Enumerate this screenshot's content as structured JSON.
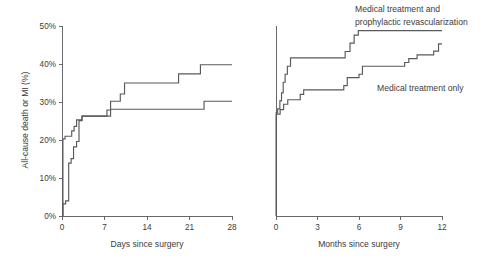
{
  "figure": {
    "title": "",
    "panels": [
      "days-panel",
      "months-panel"
    ]
  },
  "axes": {
    "y_label": "All-cause death or MI (%)",
    "y_ticks": [
      "0%",
      "10%",
      "20%",
      "30%",
      "40%",
      "50%"
    ],
    "x_label_left": "Days since surgery",
    "x_ticks_left": [
      "0",
      "7",
      "14",
      "21",
      "28"
    ],
    "x_label_right": "Months since surgery",
    "x_ticks_right": [
      "0",
      "3",
      "6",
      "9",
      "12"
    ]
  },
  "annotations": {
    "revascularization_line1": "Medical treatment and",
    "revascularization_line2": "prophylactic revascularization",
    "medical_only": "Medical treatment only"
  },
  "colors": {
    "line": "#58595b",
    "text": "#3b3b3b",
    "background": "#ffffff"
  },
  "chart_data": [
    {
      "type": "line",
      "subtype": "kaplan-meier-step",
      "id": "days-panel",
      "title": "",
      "xlabel": "Days since surgery",
      "ylabel": "All-cause death or MI (%)",
      "xlim": [
        0,
        28
      ],
      "ylim": [
        0,
        50
      ],
      "xticks": [
        0,
        7,
        14,
        21,
        28
      ],
      "yticks": [
        0,
        10,
        20,
        30,
        40,
        50
      ],
      "grid": false,
      "legend": "annotated-inline",
      "series": [
        {
          "name": "Medical treatment and prophylactic revascularization",
          "points": [
            {
              "x": 0,
              "y": 0
            },
            {
              "x": 0.15,
              "y": 20.3
            },
            {
              "x": 0.5,
              "y": 21.0
            },
            {
              "x": 1.6,
              "y": 22.4
            },
            {
              "x": 2.0,
              "y": 23.6
            },
            {
              "x": 2.4,
              "y": 25.3
            },
            {
              "x": 3.3,
              "y": 26.3
            },
            {
              "x": 7.4,
              "y": 27.9
            },
            {
              "x": 8.0,
              "y": 30.2
            },
            {
              "x": 9.6,
              "y": 32.1
            },
            {
              "x": 10.3,
              "y": 35.0
            },
            {
              "x": 19.2,
              "y": 37.4
            },
            {
              "x": 22.8,
              "y": 39.8
            },
            {
              "x": 28,
              "y": 39.8
            }
          ]
        },
        {
          "name": "Medical treatment only",
          "points": [
            {
              "x": 0,
              "y": 0
            },
            {
              "x": 0.15,
              "y": 3.2
            },
            {
              "x": 0.6,
              "y": 4.0
            },
            {
              "x": 1.1,
              "y": 13.9
            },
            {
              "x": 1.5,
              "y": 15.1
            },
            {
              "x": 1.9,
              "y": 18.2
            },
            {
              "x": 2.4,
              "y": 19.6
            },
            {
              "x": 2.8,
              "y": 25.1
            },
            {
              "x": 3.3,
              "y": 26.3
            },
            {
              "x": 7.4,
              "y": 26.3
            },
            {
              "x": 8.0,
              "y": 28.1
            },
            {
              "x": 22.8,
              "y": 28.1
            },
            {
              "x": 23.4,
              "y": 30.2
            },
            {
              "x": 28,
              "y": 30.2
            }
          ]
        }
      ]
    },
    {
      "type": "line",
      "subtype": "kaplan-meier-step",
      "id": "months-panel",
      "title": "",
      "xlabel": "Months since surgery",
      "ylabel": "All-cause death or MI (%)",
      "xlim": [
        0,
        12
      ],
      "ylim": [
        0,
        50
      ],
      "xticks": [
        0,
        3,
        6,
        9,
        12
      ],
      "yticks": [
        0,
        10,
        20,
        30,
        40,
        50
      ],
      "grid": false,
      "legend": "annotated-inline",
      "series": [
        {
          "name": "Medical treatment and prophylactic revascularization",
          "points": [
            {
              "x": 0,
              "y": 0
            },
            {
              "x": 0.02,
              "y": 27.2
            },
            {
              "x": 0.12,
              "y": 28.2
            },
            {
              "x": 0.28,
              "y": 30.3
            },
            {
              "x": 0.4,
              "y": 32.4
            },
            {
              "x": 0.52,
              "y": 35.2
            },
            {
              "x": 0.66,
              "y": 37.3
            },
            {
              "x": 0.82,
              "y": 39.4
            },
            {
              "x": 1.05,
              "y": 41.6
            },
            {
              "x": 5.0,
              "y": 43.3
            },
            {
              "x": 5.35,
              "y": 45.5
            },
            {
              "x": 5.65,
              "y": 47.6
            },
            {
              "x": 5.95,
              "y": 48.8
            },
            {
              "x": 12,
              "y": 48.8
            }
          ]
        },
        {
          "name": "Medical treatment only",
          "points": [
            {
              "x": 0,
              "y": 0
            },
            {
              "x": 0.02,
              "y": 26.8
            },
            {
              "x": 0.3,
              "y": 28.0
            },
            {
              "x": 0.55,
              "y": 29.4
            },
            {
              "x": 0.85,
              "y": 30.6
            },
            {
              "x": 1.75,
              "y": 32.0
            },
            {
              "x": 2.0,
              "y": 33.2
            },
            {
              "x": 4.9,
              "y": 34.3
            },
            {
              "x": 5.15,
              "y": 36.4
            },
            {
              "x": 6.0,
              "y": 37.3
            },
            {
              "x": 6.25,
              "y": 39.4
            },
            {
              "x": 9.3,
              "y": 40.4
            },
            {
              "x": 9.6,
              "y": 41.4
            },
            {
              "x": 10.2,
              "y": 42.4
            },
            {
              "x": 11.4,
              "y": 43.4
            },
            {
              "x": 11.75,
              "y": 45.3
            },
            {
              "x": 12,
              "y": 45.3
            }
          ]
        }
      ]
    }
  ]
}
